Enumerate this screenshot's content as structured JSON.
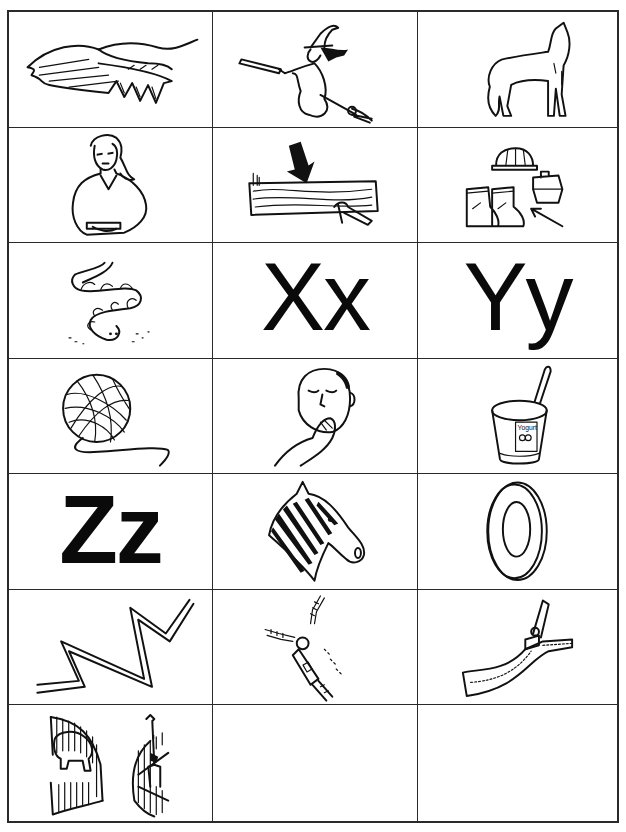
{
  "worksheet": {
    "layout": {
      "columns": 3,
      "rows": 7
    },
    "cells": [
      {
        "type": "picture",
        "subject": "wing"
      },
      {
        "type": "picture",
        "subject": "witch"
      },
      {
        "type": "picture",
        "subject": "wolf"
      },
      {
        "type": "picture",
        "subject": "woman"
      },
      {
        "type": "picture",
        "subject": "wood"
      },
      {
        "type": "picture",
        "subject": "work-boots"
      },
      {
        "type": "picture",
        "subject": "worm"
      },
      {
        "type": "letter",
        "text": "Xx"
      },
      {
        "type": "letter",
        "text": "Yy"
      },
      {
        "type": "picture",
        "subject": "yarn"
      },
      {
        "type": "picture",
        "subject": "yawn"
      },
      {
        "type": "picture",
        "subject": "yogurt",
        "label": "Yogurt"
      },
      {
        "type": "letter",
        "text": "Zz"
      },
      {
        "type": "picture",
        "subject": "zebra"
      },
      {
        "type": "picture",
        "subject": "zero"
      },
      {
        "type": "picture",
        "subject": "zigzag"
      },
      {
        "type": "picture",
        "subject": "zipper-pull"
      },
      {
        "type": "picture",
        "subject": "zipper"
      },
      {
        "type": "picture",
        "subject": "zoo"
      },
      {
        "type": "empty"
      },
      {
        "type": "empty"
      }
    ]
  }
}
